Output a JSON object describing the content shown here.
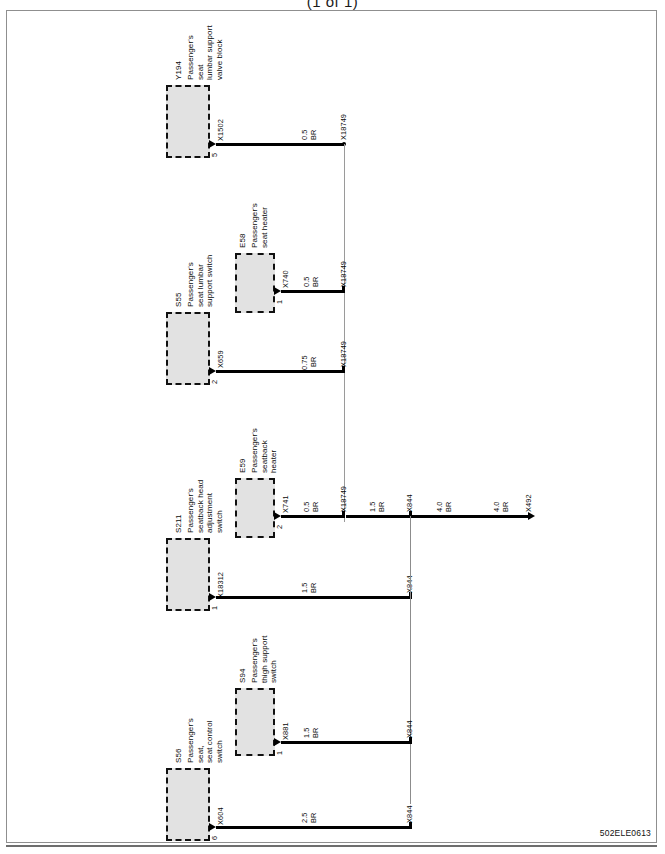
{
  "page": {
    "title": "(1 of 1)",
    "drawing_id": "502ELE0613",
    "type": "automotive wiring diagram",
    "orientation": "landscape content rotated 90 degrees",
    "wire_color_code": "BR"
  },
  "components": [
    {
      "id": "Y194",
      "name": "Passenger's\nseat\nlumbar support\nvalve block",
      "connector": "X1502",
      "pin": "5"
    },
    {
      "id": "S55",
      "name": "Passenger's\nseat lumbar\nsupport switch",
      "connector": "X659",
      "pin": "2"
    },
    {
      "id": "E58",
      "name": "Passenger's\nseat heater",
      "connector": "X740",
      "pin": "1"
    },
    {
      "id": "S211",
      "name": "Passenger's\nseatback head\nadjustment\nswitch",
      "connector": "X18312",
      "pin": "1"
    },
    {
      "id": "E59",
      "name": "Passenger's\nseatback\nheater",
      "connector": "X741",
      "pin": "2"
    },
    {
      "id": "S56",
      "name": "Passenger's\nseat,\nseat control\nswitch",
      "connector": "X604",
      "pin": "6"
    },
    {
      "id": "S94",
      "name": "Passenger's\nthigh support\nswitch",
      "connector": "X881",
      "pin": "1"
    }
  ],
  "wires": [
    {
      "from": "Y194.X1502.5",
      "gauge": "0.5",
      "color": "BR",
      "to": "X18749"
    },
    {
      "from": "E58.X740.1",
      "gauge": "0.5",
      "color": "BR",
      "to": "X18749"
    },
    {
      "from": "S55.X659.2",
      "gauge": "0.75",
      "color": "BR",
      "to": "X18749"
    },
    {
      "from": "E59.X741.2",
      "gauge": "0.5",
      "color": "BR",
      "to": "X18749"
    },
    {
      "from": "X18749",
      "gauge": "1.5",
      "color": "BR",
      "to": "X844"
    },
    {
      "from": "X844",
      "gauge": "4.0",
      "color": "BR",
      "to": "X492"
    },
    {
      "from": "S211.X18312.1",
      "gauge": "1.5",
      "color": "BR",
      "to": "X844"
    },
    {
      "from": "S94.X881.1",
      "gauge": "1.5",
      "color": "BR",
      "to": "X844"
    },
    {
      "from": "S56.X604.6",
      "gauge": "2.5",
      "color": "BR",
      "to": "X844"
    }
  ],
  "labels": {
    "gauge_05": "0.5",
    "gauge_075": "0.75",
    "gauge_15": "1.5",
    "gauge_25": "2.5",
    "gauge_40": "4.0",
    "color_br": "BR",
    "conn_x1502": "X1502",
    "conn_x659": "X659",
    "conn_x740": "X740",
    "conn_x741": "X741",
    "conn_x18312": "X18312",
    "conn_x881": "X881",
    "conn_x604": "X604",
    "splice_x18749": "X18749",
    "splice_x844": "X844",
    "terminal_x492": "X492",
    "pin_5": "5",
    "pin_2": "2",
    "pin_1": "1",
    "pin_6": "6"
  },
  "component_ids": {
    "y194": "Y194",
    "s55": "S55",
    "e58": "E58",
    "s211": "S211",
    "e59": "E59",
    "s56": "S56",
    "s94": "S94"
  },
  "component_names": {
    "y194": "Passenger's\nseat\nlumbar support\nvalve block",
    "s55": "Passenger's\nseat lumbar\nsupport switch",
    "e58": "Passenger's\nseat heater",
    "s211": "Passenger's\nseatback head\nadjustment\nswitch",
    "e59": "Passenger's\nseatback\nheater",
    "s56": "Passenger's\nseat,\nseat control\nswitch",
    "s94": "Passenger's\nthigh support\nswitch"
  }
}
